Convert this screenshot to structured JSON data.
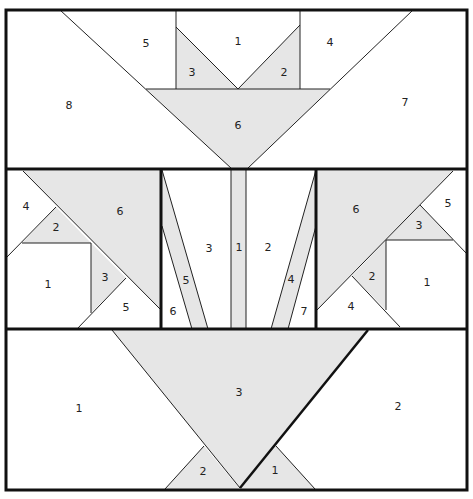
{
  "diagram": {
    "type": "quilt-block-foundation-piecing",
    "colors": {
      "shaded": "#e6e6e6",
      "line": "#222222",
      "background": "#ffffff"
    },
    "sections": {
      "top": {
        "labels": {
          "p1": "1",
          "p2": "2",
          "p3": "3",
          "p4": "4",
          "p5": "5",
          "p6": "6",
          "p7": "7",
          "p8": "8"
        }
      },
      "middle_left": {
        "labels": {
          "p1": "1",
          "p2": "2",
          "p3": "3",
          "p4": "4",
          "p5": "5",
          "p6": "6"
        }
      },
      "middle_center": {
        "labels": {
          "p1": "1",
          "p2": "2",
          "p3": "3",
          "p4": "4",
          "p5": "5",
          "p6": "6",
          "p7": "7"
        }
      },
      "middle_right": {
        "labels": {
          "p1": "1",
          "p2": "2",
          "p3": "3",
          "p4": "4",
          "p5": "5",
          "p6": "6"
        }
      },
      "bottom": {
        "labels": {
          "p1": "1",
          "p2": "2",
          "p3": "3",
          "p4": "2",
          "p5": "1"
        }
      }
    }
  }
}
